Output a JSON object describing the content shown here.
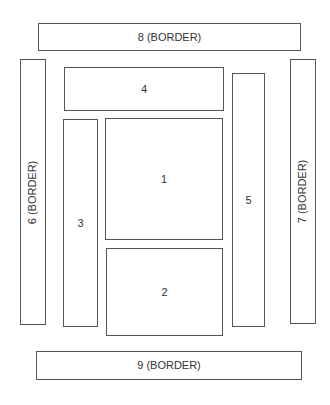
{
  "diagram": {
    "type": "layout-regions",
    "line_color": "#555555",
    "background": "#ffffff",
    "regions": [
      {
        "id": "1",
        "label": "1",
        "role": "center-top",
        "orientation": "horizontal"
      },
      {
        "id": "2",
        "label": "2",
        "role": "center-bottom",
        "orientation": "horizontal"
      },
      {
        "id": "3",
        "label": "3",
        "role": "left-inner",
        "orientation": "horizontal"
      },
      {
        "id": "4",
        "label": "4",
        "role": "top-inner",
        "orientation": "horizontal"
      },
      {
        "id": "5",
        "label": "5",
        "role": "right-inner",
        "orientation": "horizontal"
      },
      {
        "id": "6",
        "label": "6 (BORDER)",
        "role": "left-border",
        "orientation": "vertical"
      },
      {
        "id": "7",
        "label": "7 (BORDER)",
        "role": "right-border",
        "orientation": "vertical"
      },
      {
        "id": "8",
        "label": "8 (BORDER)",
        "role": "top-border",
        "orientation": "horizontal"
      },
      {
        "id": "9",
        "label": "9 (BORDER)",
        "role": "bottom-border",
        "orientation": "horizontal"
      }
    ]
  }
}
